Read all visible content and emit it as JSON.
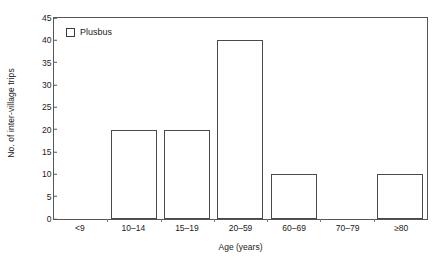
{
  "chart_data": {
    "type": "bar",
    "title": "",
    "xlabel": "Age (years)",
    "ylabel": "No. of inter-village trips",
    "categories": [
      "<9",
      "10–14",
      "15–19",
      "20–59",
      "60–69",
      "70–79",
      "≥80"
    ],
    "values": [
      0,
      20,
      20,
      40,
      10,
      0,
      10
    ],
    "series": [
      {
        "name": "Plusbus",
        "values": [
          0,
          20,
          20,
          40,
          10,
          0,
          10
        ]
      }
    ],
    "ylim": [
      0,
      45
    ],
    "ytick_step": 5,
    "yticks": [
      0,
      5,
      10,
      15,
      20,
      25,
      30,
      35,
      40,
      45
    ],
    "ytick_labels": [
      "0",
      "5",
      "10",
      "15",
      "20",
      "25",
      "30",
      "35",
      "40",
      "45"
    ],
    "grid": false,
    "legend": {
      "position": "top-left",
      "entries": [
        {
          "label": "Plusbus",
          "marker": "open-square",
          "fill": "#ffffff",
          "stroke": "#3a3a3a"
        }
      ]
    },
    "style": {
      "bar_fill": "#ffffff",
      "bar_stroke": "#4a4a4a",
      "frame_stroke": "#555555",
      "text_color": "#1a1a1a",
      "background": "#ffffff"
    }
  }
}
